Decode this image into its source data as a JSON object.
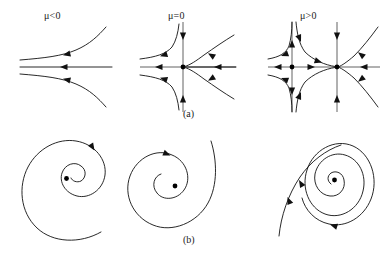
{
  "figure": {
    "title_visible": false,
    "background_color": "#ffffff",
    "line_color": "#111111",
    "axis_color": "#3a3a3a",
    "rows": [
      {
        "caption": "(a)",
        "caption_x": 186,
        "caption_y": 110,
        "description": "saddle-node bifurcation phase portraits",
        "panels": [
          {
            "label": "μ<0",
            "label_x": 50,
            "label_y": 10,
            "fixed_points": 0,
            "type": "no-fixed-point-flow"
          },
          {
            "label": "μ=0",
            "label_x": 172,
            "label_y": 10,
            "fixed_points": 1,
            "type": "saddle-node"
          },
          {
            "label": "μ>0",
            "label_x": 303,
            "label_y": 10,
            "fixed_points": 2,
            "type": "saddle-and-node"
          }
        ]
      },
      {
        "caption": "(b)",
        "caption_x": 186,
        "caption_y": 236,
        "description": "spiral phase portraits (Hopf bifurcation)",
        "panels": [
          {
            "label": "",
            "spiral": "stable-inward-spiral",
            "center_dot": true,
            "arrow_direction": "clockwise"
          },
          {
            "label": "",
            "spiral": "stable-inward-spiral",
            "center_dot": true,
            "arrow_direction": "clockwise"
          },
          {
            "label": "",
            "spiral": "unstable-spiral-with-limit-cycle",
            "center_dot": true,
            "arrow_direction": "clockwise"
          }
        ]
      }
    ]
  },
  "labels": {
    "mu_neg": "μ<0",
    "mu_zero": "μ=0",
    "mu_pos": "μ>0",
    "caption_a": "(a)",
    "caption_b": "(b)"
  }
}
